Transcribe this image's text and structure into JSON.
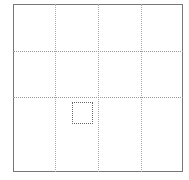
{
  "grid": {
    "rows": 3,
    "columns": 4,
    "vertical_lines_x": [
      55,
      98,
      141
    ],
    "horizontal_lines_y": [
      51,
      97
    ],
    "line_color": "#aaaaaa",
    "border_color": "#777777"
  },
  "selection": {
    "left": 72,
    "top": 102,
    "width": 21,
    "height": 22
  }
}
